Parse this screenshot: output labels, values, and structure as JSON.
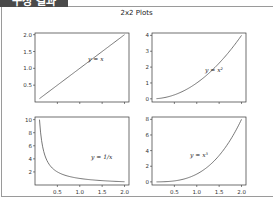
{
  "header": {
    "tab_label": "구성 결과"
  },
  "figure": {
    "title": "2x2 Plots"
  },
  "chart_data": [
    {
      "type": "line",
      "position": "top-left",
      "title": "",
      "annotation": "y = x",
      "x": [
        0.1,
        0.5,
        1.0,
        1.5,
        2.0
      ],
      "values": [
        0.1,
        0.5,
        1.0,
        1.5,
        2.0
      ],
      "xlim": [
        0.1,
        2.0
      ],
      "ylim": [
        0.1,
        2.0
      ],
      "yticks": [
        "0.5",
        "1.0",
        "1.5",
        "2.0"
      ],
      "xticks": [],
      "grid": false
    },
    {
      "type": "line",
      "position": "top-right",
      "title": "",
      "annotation": "y = x²",
      "x": [
        0.1,
        0.5,
        1.0,
        1.5,
        2.0
      ],
      "values": [
        0.01,
        0.25,
        1.0,
        2.25,
        4.0
      ],
      "xlim": [
        0.1,
        2.0
      ],
      "ylim": [
        0,
        4
      ],
      "yticks": [
        "0",
        "1",
        "2",
        "3",
        "4"
      ],
      "xticks": [],
      "grid": false
    },
    {
      "type": "line",
      "position": "bottom-left",
      "title": "",
      "annotation": "y = 1/x",
      "x": [
        0.1,
        0.2,
        0.5,
        1.0,
        1.5,
        2.0
      ],
      "values": [
        10,
        5,
        2,
        1,
        0.667,
        0.5
      ],
      "xlim": [
        0.1,
        2.0
      ],
      "ylim": [
        0.5,
        10
      ],
      "yticks": [
        "2",
        "4",
        "6",
        "8",
        "10"
      ],
      "xticks": [
        "0.5",
        "1.0",
        "1.5",
        "2.0"
      ],
      "grid": false
    },
    {
      "type": "line",
      "position": "bottom-right",
      "title": "",
      "annotation": "y = x³",
      "x": [
        0.1,
        0.5,
        1.0,
        1.5,
        2.0
      ],
      "values": [
        0.001,
        0.125,
        1.0,
        3.375,
        8.0
      ],
      "xlim": [
        0.1,
        2.0
      ],
      "ylim": [
        0,
        8
      ],
      "yticks": [
        "0",
        "2",
        "4",
        "6",
        "8"
      ],
      "xticks": [
        "0.5",
        "1.0",
        "1.5",
        "2.0"
      ],
      "grid": false
    }
  ]
}
